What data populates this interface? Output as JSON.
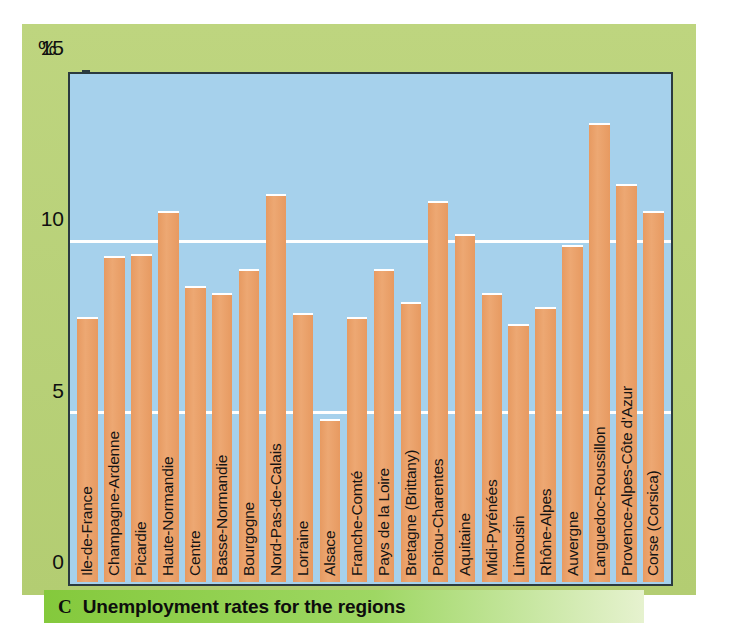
{
  "figure": {
    "panel_color": "#b9d179",
    "plot_bg_color": "#a6d1ec",
    "bar_color": "#e9a06a",
    "gridline_color": "#ffffff",
    "caption_bg_color": "#8fce4a"
  },
  "caption": {
    "letter": "C",
    "text": "Unemployment rates for the regions"
  },
  "axis": {
    "y_unit_label": "%",
    "y_ticks": [
      "0",
      "5",
      "10",
      "15"
    ]
  },
  "chart_data": {
    "type": "bar",
    "title": "Unemployment rates for the regions",
    "xlabel": "",
    "ylabel": "%",
    "ylim": [
      0,
      15
    ],
    "yticks": [
      0,
      5,
      10,
      15
    ],
    "grid": true,
    "legend": "none",
    "categories": [
      "Ile-de-France",
      "Champagne-Ardenne",
      "Picardie",
      "Haute-Normandie",
      "Centre",
      "Basse-Normandie",
      "Bourgogne",
      "Nord-Pas-de-Calais",
      "Lorraine",
      "Alsace",
      "Franche-Comté",
      "Pays de la Loire",
      "Bretagne (Brittany)",
      "Poitou-Charentes",
      "Aquitaine",
      "Midi-Pyrénées",
      "Limousin",
      "Rhône-Alpes",
      "Auvergne",
      "Languedoc-Roussillon",
      "Provence-Alpes-Côte d'Azur",
      "Corse (Corsica)"
    ],
    "values": [
      7.8,
      9.6,
      9.65,
      10.9,
      8.7,
      8.5,
      9.2,
      11.4,
      7.9,
      4.8,
      7.8,
      9.2,
      8.25,
      11.2,
      10.25,
      8.5,
      7.6,
      8.1,
      9.9,
      13.5,
      11.7,
      10.9
    ]
  }
}
